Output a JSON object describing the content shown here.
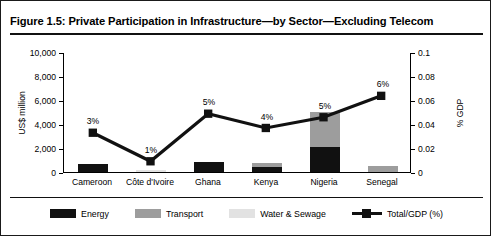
{
  "figure": {
    "title": "Figure 1.5: Private Participation in Infrastructure—by Sector—Excluding Telecom"
  },
  "axes": {
    "left_title": "US$ million",
    "right_title": "% GDP",
    "left_ticks": [
      "10,000",
      "8,000",
      "6,000",
      "4,000",
      "2,000",
      "0"
    ],
    "right_ticks": [
      "0.1",
      "0.08",
      "0.06",
      "0.04",
      "0.02",
      "0"
    ]
  },
  "legend": {
    "items": [
      {
        "label": "Energy",
        "color": "#111111",
        "marker": "swatch"
      },
      {
        "label": "Transport",
        "color": "#9d9d9d",
        "marker": "swatch"
      },
      {
        "label": "Water & Sewage",
        "color": "#e2e2e2",
        "marker": "swatch"
      },
      {
        "label": "Total/GDP (%)",
        "color": "#111111",
        "marker": "line-square"
      }
    ]
  },
  "chart_data": {
    "type": "bar",
    "title": "Figure 1.5: Private Participation in Infrastructure—by Sector—Excluding Telecom",
    "xlabel": "",
    "ylabel": "US$ million",
    "y2label": "% GDP",
    "ylim": [
      0,
      10000
    ],
    "y2lim": [
      0,
      0.1
    ],
    "ytick_step": 2000,
    "y2tick_step": 0.02,
    "grid": false,
    "legend_position": "bottom",
    "stacked": true,
    "categories": [
      "Cameroon",
      "Côte d'Ivoire",
      "Ghana",
      "Kenya",
      "Nigeria",
      "Senegal"
    ],
    "series": [
      {
        "name": "Energy",
        "axis": "left",
        "color": "#111111",
        "values": [
          700,
          0,
          800,
          400,
          2100,
          0
        ]
      },
      {
        "name": "Transport",
        "axis": "left",
        "color": "#9d9d9d",
        "values": [
          0,
          0,
          0,
          350,
          2900,
          500
        ]
      },
      {
        "name": "Water & Sewage",
        "axis": "left",
        "color": "#e2e2e2",
        "values": [
          0,
          150,
          0,
          0,
          0,
          0
        ]
      },
      {
        "name": "Total/GDP (%)",
        "axis": "right",
        "color": "#111111",
        "type": "line",
        "values": [
          0.033,
          0.009,
          0.049,
          0.037,
          0.046,
          0.064
        ],
        "point_labels": [
          "3%",
          "1%",
          "5%",
          "4%",
          "5%",
          "6%"
        ]
      }
    ]
  }
}
